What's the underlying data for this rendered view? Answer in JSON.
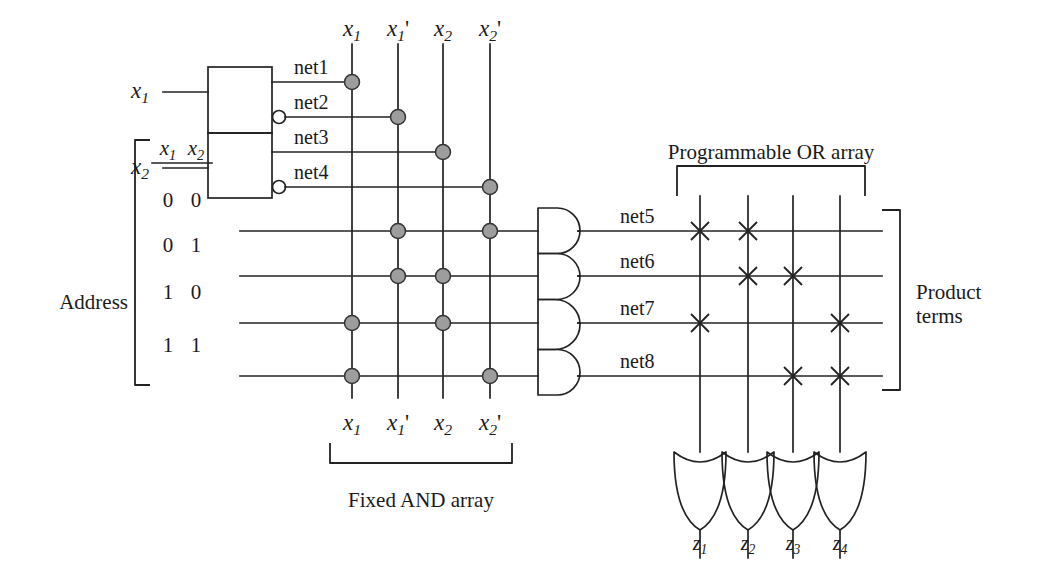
{
  "figure": {
    "type": "logic-diagram",
    "captions": {
      "address": "Address",
      "fixed_and_array": "Fixed AND array",
      "programmable_or_array": "Programmable OR array",
      "product_terms": "Product terms"
    }
  },
  "inputs": {
    "items": [
      {
        "name": "x1",
        "base": "x",
        "sub": "1",
        "prime": "",
        "x": 140,
        "y": 92
      },
      {
        "name": "x2",
        "base": "x",
        "sub": "2",
        "prime": "",
        "x": 140,
        "y": 168
      }
    ]
  },
  "decoder": {
    "outputs": [
      {
        "label": "net1",
        "inverted": false,
        "y": 82
      },
      {
        "label": "net2",
        "inverted": true,
        "y": 117
      },
      {
        "label": "net3",
        "inverted": false,
        "y": 152
      },
      {
        "label": "net4",
        "inverted": true,
        "y": 187
      }
    ]
  },
  "address_table": {
    "headers": [
      {
        "base": "x",
        "sub": "1"
      },
      {
        "base": "x",
        "sub": "2"
      }
    ],
    "rows": [
      {
        "values": [
          "0",
          "0"
        ],
        "y": 231
      },
      {
        "values": [
          "0",
          "1"
        ],
        "y": 276
      },
      {
        "values": [
          "1",
          "0"
        ],
        "y": 323
      },
      {
        "values": [
          "1",
          "1"
        ],
        "y": 376
      }
    ]
  },
  "and_array": {
    "columns": [
      {
        "name": "x1",
        "base": "x",
        "sub": "1",
        "prime": "",
        "x": 352
      },
      {
        "name": "x1p",
        "base": "x",
        "sub": "1",
        "prime": "'",
        "x": 398
      },
      {
        "name": "x2",
        "base": "x",
        "sub": "2",
        "prime": "",
        "x": 443
      },
      {
        "name": "x2p",
        "base": "x",
        "sub": "2",
        "prime": "'",
        "x": 490
      }
    ],
    "decoder_connections": [
      {
        "net": "net1",
        "column": "x1",
        "x": 352,
        "y": 82
      },
      {
        "net": "net2",
        "column": "x1p",
        "x": 398,
        "y": 117
      },
      {
        "net": "net3",
        "column": "x2",
        "x": 443,
        "y": 152
      },
      {
        "net": "net4",
        "column": "x2p",
        "x": 490,
        "y": 187
      }
    ],
    "crosspoints": [
      {
        "row": "00",
        "column": "x1p",
        "x": 398,
        "y": 231
      },
      {
        "row": "00",
        "column": "x2p",
        "x": 490,
        "y": 231
      },
      {
        "row": "01",
        "column": "x1p",
        "x": 398,
        "y": 276
      },
      {
        "row": "01",
        "column": "x2",
        "x": 443,
        "y": 276
      },
      {
        "row": "10",
        "column": "x1",
        "x": 352,
        "y": 323
      },
      {
        "row": "10",
        "column": "x2",
        "x": 443,
        "y": 323
      },
      {
        "row": "11",
        "column": "x1",
        "x": 352,
        "y": 376
      },
      {
        "row": "11",
        "column": "x2p",
        "x": 490,
        "y": 376
      }
    ],
    "dot_color": "#9d9d9d"
  },
  "and_gates": {
    "items": [
      {
        "net": "net5",
        "y": 231
      },
      {
        "net": "net6",
        "y": 276
      },
      {
        "net": "net7",
        "y": 323
      },
      {
        "net": "net8",
        "y": 376
      }
    ]
  },
  "or_array": {
    "columns": [
      {
        "output": "z1",
        "x": 700
      },
      {
        "output": "z2",
        "x": 748
      },
      {
        "output": "z3",
        "x": 793
      },
      {
        "output": "z4",
        "x": 840
      }
    ],
    "crosspoints": [
      {
        "net": "net5",
        "output": "z1",
        "x": 700,
        "y": 231
      },
      {
        "net": "net5",
        "output": "z2",
        "x": 748,
        "y": 231
      },
      {
        "net": "net6",
        "output": "z2",
        "x": 748,
        "y": 276
      },
      {
        "net": "net6",
        "output": "z3",
        "x": 793,
        "y": 276
      },
      {
        "net": "net7",
        "output": "z1",
        "x": 700,
        "y": 323
      },
      {
        "net": "net7",
        "output": "z4",
        "x": 840,
        "y": 323
      },
      {
        "net": "net8",
        "output": "z3",
        "x": 793,
        "y": 376
      },
      {
        "net": "net8",
        "output": "z4",
        "x": 840,
        "y": 376
      }
    ]
  },
  "outputs": {
    "items": [
      {
        "name": "z1",
        "base": "z",
        "sub": "1",
        "x": 700
      },
      {
        "name": "z2",
        "base": "z",
        "sub": "2",
        "x": 748
      },
      {
        "name": "z3",
        "base": "z",
        "sub": "3",
        "x": 793
      },
      {
        "name": "z4",
        "base": "z",
        "sub": "4",
        "x": 840
      }
    ]
  }
}
